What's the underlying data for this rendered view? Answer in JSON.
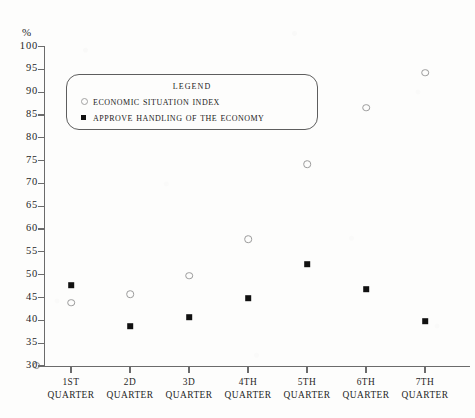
{
  "chart_data": {
    "type": "scatter",
    "title": "",
    "xlabel": "",
    "ylabel": "%",
    "ylim": [
      30,
      100
    ],
    "ytick_step": 5,
    "yticks": [
      100,
      95,
      90,
      85,
      80,
      75,
      70,
      65,
      60,
      55,
      50,
      45,
      40,
      35,
      30
    ],
    "grid": false,
    "legend_position": "upper-left-inside",
    "legend_title": "Legend",
    "categories": [
      "1st Quarter",
      "2d Quarter",
      "3d Quarter",
      "4th Quarter",
      "5th Quarter",
      "6th Quarter",
      "7th Quarter"
    ],
    "category_lines": [
      [
        "1st",
        "Quarter"
      ],
      [
        "2d",
        "Quarter"
      ],
      [
        "3d",
        "Quarter"
      ],
      [
        "4th",
        "Quarter"
      ],
      [
        "5th",
        "Quarter"
      ],
      [
        "6th",
        "Quarter"
      ],
      [
        "7th",
        "Quarter"
      ]
    ],
    "series": [
      {
        "name": "Economic Situation Index",
        "marker": "open-circle",
        "color": "#9b9b9b",
        "values": [
          43.9,
          45.7,
          49.8,
          57.8,
          74.2,
          86.6,
          94.3
        ]
      },
      {
        "name": "Approve Handling of the Economy",
        "marker": "filled-square",
        "color": "#111111",
        "values": [
          47.7,
          38.7,
          40.7,
          44.8,
          52.3,
          46.8,
          39.8
        ]
      }
    ]
  },
  "axis": {
    "y_unit_label": "%"
  }
}
